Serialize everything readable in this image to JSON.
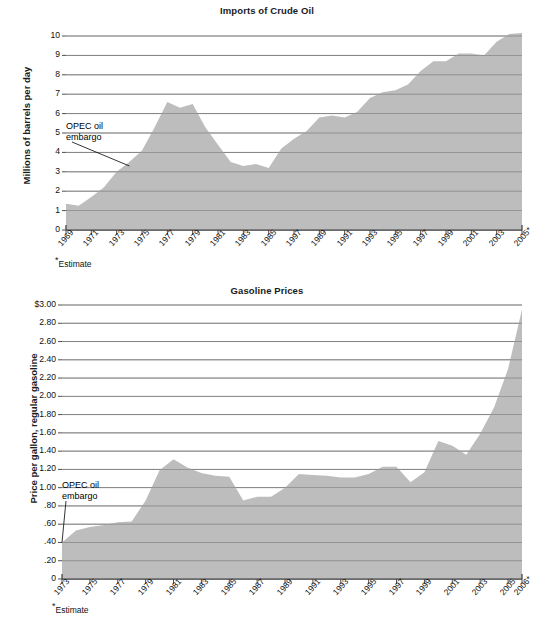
{
  "page": {
    "background": "#ffffff",
    "area_fill": "#bdbdbd",
    "grid_color": "#6e6e6e",
    "axis_color": "#3a3a3a",
    "text_color": "#111111"
  },
  "chart_data": [
    {
      "id": "imports-of-crude-oil",
      "type": "area",
      "title": "Imports of Crude Oil",
      "xlabel": "",
      "ylabel": "Millions of barrels per day",
      "ylim": [
        0,
        10
      ],
      "ytick_labels": [
        "10",
        "9",
        "8",
        "7",
        "6",
        "5",
        "4",
        "3",
        "2",
        "1",
        "0"
      ],
      "ytick_values": [
        10,
        9,
        8,
        7,
        6,
        5,
        4,
        3,
        2,
        1,
        0
      ],
      "grid": true,
      "legend": "none",
      "xtick_labels": [
        "1969",
        "1971",
        "1973",
        "1975",
        "1977",
        "1979",
        "1981",
        "1983",
        "1985",
        "1997",
        "1989",
        "1991",
        "1993",
        "1995",
        "1997",
        "1999",
        "2001",
        "2003",
        "2005*"
      ],
      "xtick_values": [
        1969,
        1971,
        1973,
        1975,
        1977,
        1979,
        1981,
        1983,
        1985,
        1987,
        1989,
        1991,
        1993,
        1995,
        1997,
        1999,
        2001,
        2003,
        2005
      ],
      "xlim": [
        1969,
        2005
      ],
      "x": [
        1969,
        1970,
        1971,
        1972,
        1973,
        1974,
        1975,
        1976,
        1977,
        1978,
        1979,
        1980,
        1981,
        1982,
        1983,
        1984,
        1985,
        1986,
        1987,
        1988,
        1989,
        1990,
        1991,
        1992,
        1993,
        1994,
        1995,
        1996,
        1997,
        1998,
        1999,
        2000,
        2001,
        2002,
        2003,
        2004,
        2005
      ],
      "values": [
        1.35,
        1.25,
        1.7,
        2.2,
        3.0,
        3.5,
        4.1,
        5.3,
        6.6,
        6.3,
        6.5,
        5.3,
        4.4,
        3.5,
        3.3,
        3.4,
        3.2,
        4.2,
        4.7,
        5.1,
        5.8,
        5.9,
        5.8,
        6.1,
        6.8,
        7.1,
        7.2,
        7.5,
        8.2,
        8.7,
        8.7,
        9.1,
        9.1,
        9.0,
        9.7,
        10.1,
        10.15
      ],
      "annotation": {
        "text_lines": [
          "OPEC oil",
          "embargo"
        ],
        "points_to_year": 1974,
        "points_to_value": 3.3
      },
      "footnote": "*Estimate"
    },
    {
      "id": "gasoline-prices",
      "type": "area",
      "title": "Gasoline Prices",
      "xlabel": "",
      "ylabel": "Price per gallon, regular gasoline",
      "ylim": [
        0,
        3.0
      ],
      "ytick_labels": [
        "$3.00",
        "2.80",
        "2.60",
        "2.40",
        "2.20",
        "2.00",
        "1.80",
        "1.60",
        "1.40",
        "1.20",
        "1.00",
        ".80",
        ".60",
        ".40",
        ".20",
        "0"
      ],
      "ytick_values": [
        3.0,
        2.8,
        2.6,
        2.4,
        2.2,
        2.0,
        1.8,
        1.6,
        1.4,
        1.2,
        1.0,
        0.8,
        0.6,
        0.4,
        0.2,
        0
      ],
      "grid": true,
      "legend": "none",
      "xtick_labels": [
        "1973",
        "1975",
        "1977",
        "1979",
        "1981",
        "1983",
        "1985",
        "1987",
        "1989",
        "1991",
        "1993",
        "1995",
        "1997",
        "1999",
        "2001",
        "2003",
        "2005",
        "2006*"
      ],
      "xtick_values": [
        1973,
        1975,
        1977,
        1979,
        1981,
        1983,
        1985,
        1987,
        1989,
        1991,
        1993,
        1995,
        1997,
        1999,
        2001,
        2003,
        2005,
        2006
      ],
      "xlim": [
        1973,
        2006
      ],
      "x": [
        1973,
        1974,
        1975,
        1976,
        1977,
        1978,
        1979,
        1980,
        1981,
        1982,
        1983,
        1984,
        1985,
        1986,
        1987,
        1988,
        1989,
        1990,
        1991,
        1992,
        1993,
        1994,
        1995,
        1996,
        1997,
        1998,
        1999,
        2000,
        2001,
        2002,
        2003,
        2004,
        2005,
        2006
      ],
      "values": [
        0.4,
        0.53,
        0.57,
        0.59,
        0.62,
        0.63,
        0.86,
        1.19,
        1.31,
        1.22,
        1.16,
        1.13,
        1.12,
        0.86,
        0.9,
        0.9,
        1.0,
        1.15,
        1.14,
        1.13,
        1.11,
        1.11,
        1.15,
        1.23,
        1.23,
        1.06,
        1.17,
        1.51,
        1.46,
        1.36,
        1.59,
        1.88,
        2.3,
        2.95
      ],
      "annotation": {
        "text_lines": [
          "OPEC oil",
          "embargo"
        ],
        "points_to_year": 1973,
        "points_to_value": 0.4
      },
      "footnote": "*Estimate"
    }
  ]
}
